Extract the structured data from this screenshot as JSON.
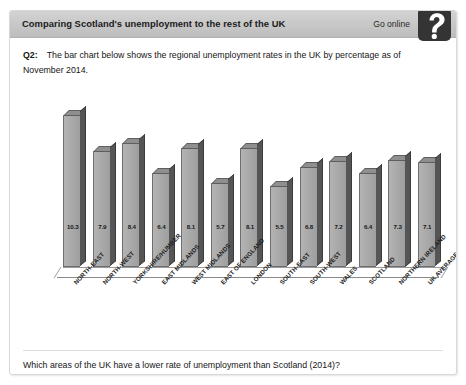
{
  "header": {
    "title": "Comparing Scotland's unemployment to the rest of the UK",
    "go_online_label": "Go online",
    "help_icon": "question-mark-icon",
    "bar_color": "#c9c9c9"
  },
  "question": {
    "number": "Q2:",
    "text": "The bar chart below shows the regional unemployment rates in the UK by percentage as of November 2014."
  },
  "footer": {
    "question": "Which areas of the UK have a lower rate of unemployment than Scotland (2014)?"
  },
  "chart_data": {
    "type": "bar",
    "title": "",
    "xlabel": "",
    "ylabel": "",
    "ylim": [
      0,
      11
    ],
    "grid": false,
    "legend": "none",
    "categories": [
      "NORTH-EAST",
      "NORTH-WEST",
      "YORKSHIRE/HUMBER",
      "EAST MIDLANDS",
      "WEST MIDLANDS",
      "EAST OF ENGLAND",
      "LONDON",
      "SOUTH-EAST",
      "SOUTH-WEST",
      "WALES",
      "SCOTLAND",
      "NORTHERN IRELAND",
      "UK AVERAGE"
    ],
    "values": [
      10.3,
      7.9,
      8.4,
      6.4,
      8.1,
      5.7,
      8.1,
      5.5,
      6.8,
      7.2,
      6.4,
      7.3,
      7.1
    ],
    "value_labels": [
      "10.3",
      "7.9",
      "8.4",
      "6.4",
      "8.1",
      "5.7",
      "8.1",
      "5.5",
      "6.8",
      "7.2",
      "6.4",
      "7.3",
      "7.1"
    ],
    "bar_fill_color": "#a8a8a8",
    "bar_edge_color": "#6e6e6e",
    "bar_side_color": "#555555"
  }
}
